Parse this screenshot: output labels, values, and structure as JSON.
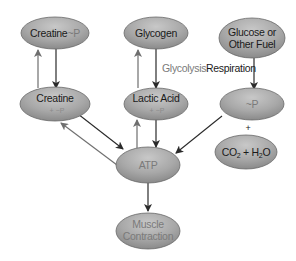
{
  "diagram": {
    "colors": {
      "node_fill_light": "#c4c4c4",
      "node_fill_dark": "#8c8c8c",
      "arrow": "#2a2a2a",
      "arrow_light": "#6e6e6e",
      "label_dark": "#1a1a1a",
      "label_faint": "#7a7a7a",
      "glycolysis_label": "#7a7a7a"
    },
    "nodes": {
      "creatine_p": {
        "label": "Creatine",
        "suffix": "~P"
      },
      "glycogen": {
        "label": "Glycogen"
      },
      "glucose": {
        "line1": "Glucose or",
        "line2": "Other Fuel"
      },
      "creatine": {
        "label": "Creatine",
        "sub": "+ ~P"
      },
      "lactic_acid": {
        "label": "Lactic Acid",
        "sub": "+ ~P"
      },
      "phosphate": {
        "label": "~P"
      },
      "plus": {
        "label": "+"
      },
      "co2_h2o": {
        "co": "CO",
        "co_sub": "2",
        "plus": " + H",
        "h_sub": "2",
        "o": "O"
      },
      "atp": {
        "label": "ATP"
      },
      "muscle": {
        "line1": "Muscle",
        "line2": "Contraction"
      }
    },
    "edge_labels": {
      "glycolysis": "Glycolysis",
      "respiration": "Respiration"
    },
    "edges": [
      {
        "from": "creatine",
        "to": "creatine_p"
      },
      {
        "from": "creatine_p",
        "to": "creatine"
      },
      {
        "from": "lactic_acid",
        "to": "glycogen"
      },
      {
        "from": "glycogen",
        "to": "lactic_acid",
        "label": "Glycolysis"
      },
      {
        "from": "glucose",
        "to": "phosphate",
        "label": "Respiration"
      },
      {
        "from": "creatine",
        "to": "atp"
      },
      {
        "from": "atp",
        "to": "creatine"
      },
      {
        "from": "atp",
        "to": "lactic_acid"
      },
      {
        "from": "lactic_acid",
        "to": "atp"
      },
      {
        "from": "phosphate",
        "to": "atp"
      },
      {
        "from": "atp",
        "to": "muscle"
      }
    ]
  }
}
